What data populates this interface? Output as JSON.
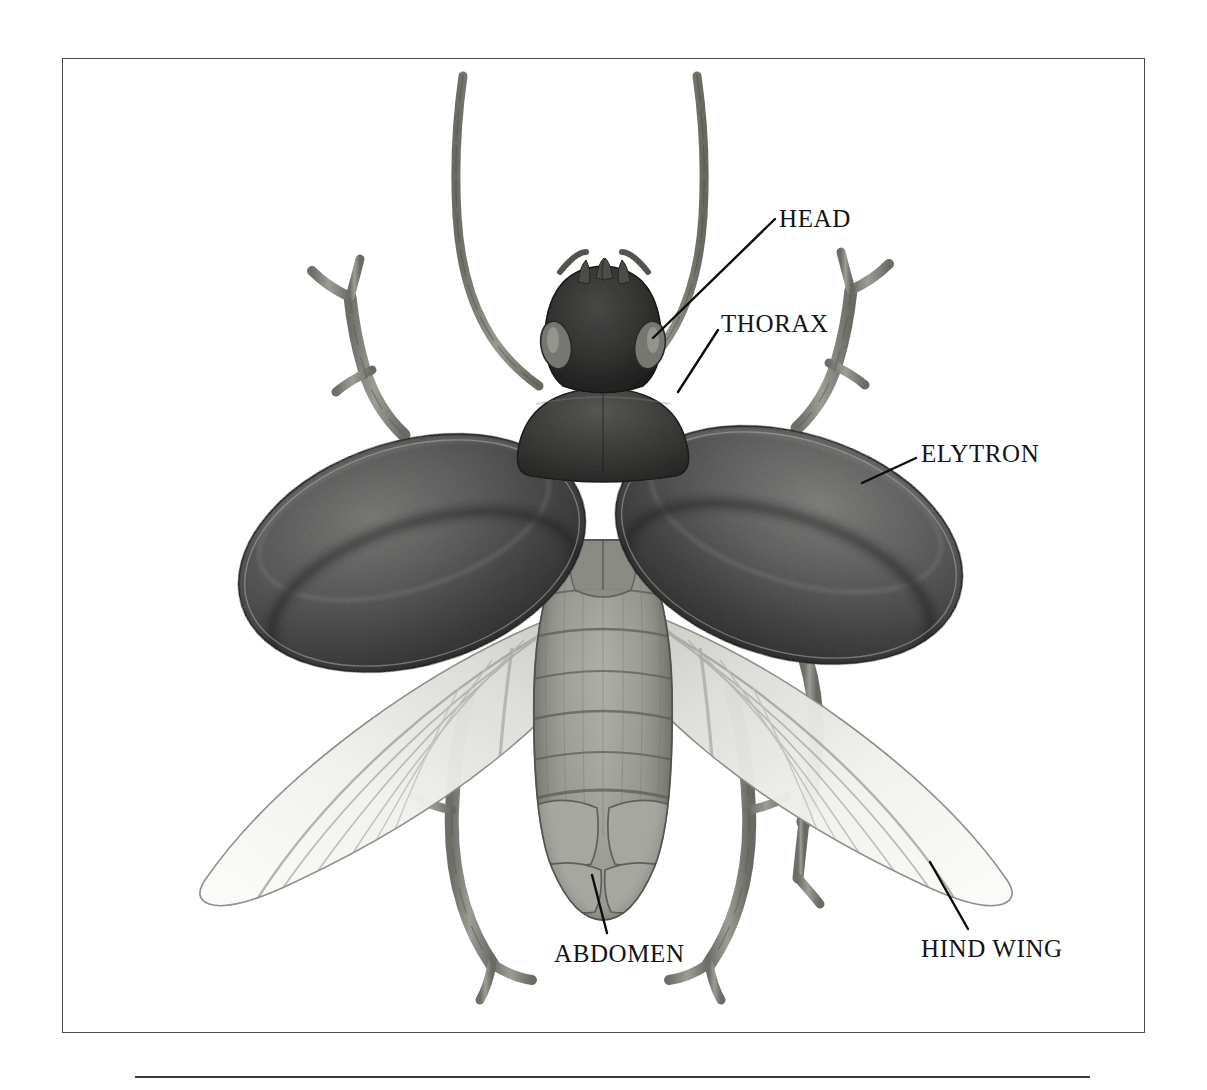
{
  "figure": {
    "kind": "scientific-illustration",
    "view": "dorsal view with elytra raised and hind wings extended",
    "medium": "graphite / stipple drawing",
    "frame": {
      "border_color": "#4a4a4a",
      "background": "#ffffff"
    },
    "bottom_rule_color": "#3a3a3a"
  },
  "labels": [
    {
      "id": "head",
      "text": "HEAD",
      "leader": {
        "from_x": 775,
        "from_y": 219,
        "to_x": 653,
        "to_y": 338
      }
    },
    {
      "id": "thorax",
      "text": "THORAX",
      "leader": {
        "from_x": 718,
        "from_y": 330,
        "to_x": 678,
        "to_y": 392
      }
    },
    {
      "id": "elytron",
      "text": "ELYTRON",
      "leader": {
        "from_x": 916,
        "from_y": 458,
        "to_x": 862,
        "to_y": 483
      }
    },
    {
      "id": "abdomen",
      "text": "ABDOMEN",
      "leader": {
        "from_x": 607,
        "from_y": 933,
        "to_x": 592,
        "to_y": 875
      }
    },
    {
      "id": "hind-wing",
      "text": "HIND WING",
      "leader": {
        "from_x": 968,
        "from_y": 929,
        "to_x": 930,
        "to_y": 862
      }
    }
  ],
  "anatomy": {
    "antennae": {
      "count": 2,
      "shape": "long curved segmented filaments forming a V"
    },
    "head": {
      "eyes": 2,
      "mouthparts": "mandibles and palps"
    },
    "thorax": {
      "shape": "broad trapezoidal pronotum"
    },
    "elytra": {
      "count": 2,
      "color": "#4e4e4e",
      "texture": "dense stipple"
    },
    "hind_wings": {
      "count": 2,
      "color": "#e9e9e6",
      "texture": "translucent with veins"
    },
    "abdomen": {
      "segments": 6,
      "color": "#9a9a96"
    },
    "legs": {
      "count": 6,
      "color": "#8a8a84"
    }
  },
  "palette": {
    "ink": "#141414",
    "frame": "#4a4a4a",
    "elytron_dark": "#3b3b3b",
    "elytron_mid": "#5a5a5a",
    "elytron_light": "#8c8c8c",
    "wing_light": "#efefec",
    "wing_shade": "#c9c9c4",
    "body_mid": "#9b9b95",
    "leg": "#8d8d86",
    "paper": "#ffffff"
  }
}
